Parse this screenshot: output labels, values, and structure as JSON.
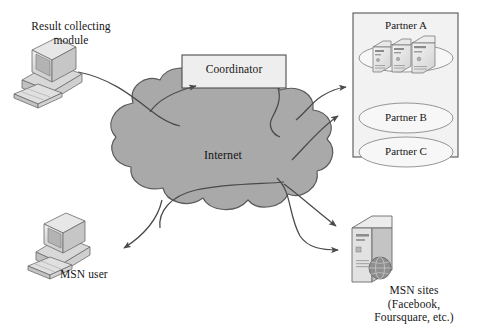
{
  "diagram": {
    "background_color": "#ffffff",
    "cloud": {
      "label": "Internet",
      "fill_color": "#a9a9a9",
      "stroke_color": "#5b5b5b"
    },
    "coordinator": {
      "label": "Coordinator",
      "fill_color": "#eeeeee",
      "stroke_color": "#4d4d4d"
    },
    "result_module": {
      "label": "Result collecting\nmodule",
      "icon": "desktop-computer-icon"
    },
    "msn_user": {
      "label": "MSN user",
      "icon": "desktop-computer-icon"
    },
    "msn_sites": {
      "label": "MSN sites\n(Facebook,\nFoursquare, etc.)",
      "icon": "server-tower-globe-icon"
    },
    "partner_box": {
      "border_color": "#555555",
      "fill_color": "#f2f2f2",
      "partners": [
        {
          "label": "Partner A",
          "has_servers": true,
          "server_count": 3
        },
        {
          "label": "Partner B",
          "has_servers": false,
          "server_count": 0
        },
        {
          "label": "Partner C",
          "has_servers": false,
          "server_count": 0
        }
      ]
    },
    "connections": [
      {
        "name": "result-module-to-cloud",
        "from": "Result collecting module",
        "to": "Internet",
        "arrow": false
      },
      {
        "name": "cloud-to-coordinator",
        "from": "Internet",
        "to": "Coordinator",
        "arrow": true
      },
      {
        "name": "coordinator-to-cloud",
        "from": "Coordinator",
        "to": "Internet",
        "arrow": false
      },
      {
        "name": "cloud-to-partner-upper",
        "from": "Internet",
        "to": "Partner box",
        "arrow": true
      },
      {
        "name": "cloud-to-partner-lower",
        "from": "Internet",
        "to": "Partner box",
        "arrow": true
      },
      {
        "name": "cloud-to-msn-sites-upper",
        "from": "Internet",
        "to": "MSN sites",
        "arrow": true
      },
      {
        "name": "cloud-to-msn-sites-lower",
        "from": "Internet",
        "to": "MSN sites",
        "arrow": true
      },
      {
        "name": "cloud-to-msn-user",
        "from": "Internet",
        "to": "MSN user",
        "arrow": true
      }
    ]
  }
}
